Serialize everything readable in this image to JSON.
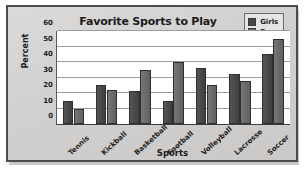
{
  "chart_data": {
    "type": "bar",
    "title": "Favorite Sports to Play",
    "xlabel": "Sports",
    "ylabel": "Percent",
    "categories": [
      "Tennis",
      "Kickball",
      "Basketball",
      "Football",
      "Volleyball",
      "Lacrosse",
      "Soccer"
    ],
    "series": [
      {
        "name": "Girls",
        "color": "#484848",
        "values": [
          15,
          25,
          21,
          15,
          36,
          32,
          45
        ]
      },
      {
        "name": "Boys",
        "color": "#6a6a6a",
        "values": [
          10,
          22,
          35,
          40,
          25,
          28,
          55
        ]
      }
    ],
    "ylim": [
      0,
      60
    ],
    "yticks": [
      0,
      10,
      20,
      30,
      40,
      50,
      60
    ],
    "ytick_labels": [
      "0",
      "10",
      "20",
      "30",
      "40",
      "50",
      "60"
    ],
    "grid": "horizontal",
    "legend_position": "top-right",
    "plot_background": "#ffffff",
    "panel_background": "#d4d2d0",
    "border_color": "#4c4c4c"
  }
}
